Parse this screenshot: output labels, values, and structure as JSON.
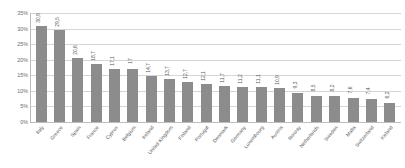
{
  "chart_data": {
    "type": "bar",
    "title": "",
    "xlabel": "",
    "ylabel": "",
    "ylim": [
      0,
      35
    ],
    "ytick_labels": [
      "35%",
      "30%",
      "25%",
      "20%",
      "15%",
      "10%",
      "5%",
      "0%"
    ],
    "ytick_values": [
      35,
      30,
      25,
      20,
      15,
      10,
      5,
      0
    ],
    "grid": true,
    "legend": "none",
    "bar_color": "#8c8c8c",
    "categories": [
      "Italy",
      "Greece",
      "Spain",
      "France",
      "Cyprus",
      "Belgium",
      "Ireland",
      "United Kingdom",
      "Finland",
      "Portugal",
      "Denmark",
      "Germany",
      "Luxembourg",
      "Austria",
      "Norway",
      "Netherlands",
      "Sweden",
      "Malta",
      "Switzerland",
      "Iceland"
    ],
    "values": [
      30.9,
      29.5,
      20.6,
      18.7,
      17.1,
      17.0,
      14.7,
      13.7,
      12.7,
      12.1,
      11.7,
      11.2,
      11.1,
      10.9,
      9.3,
      8.5,
      8.2,
      7.6,
      7.4,
      6.2
    ],
    "value_labels": [
      "30,9",
      "29,5",
      "20,6",
      "18,7",
      "17,1",
      "17",
      "14,7",
      "13,7",
      "12,7",
      "12,1",
      "11,7",
      "11,2",
      "11,1",
      "10,9",
      "9,3",
      "8,5",
      "8,2",
      "7,6",
      "7,4",
      "6,2"
    ]
  }
}
